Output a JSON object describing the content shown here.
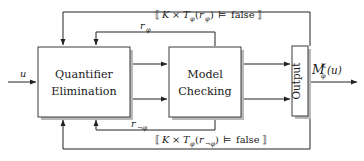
{
  "diagram": {
    "blocks": [
      {
        "id": "quantifier-elimination",
        "line1": "Quantifier",
        "line2": "Elimination"
      },
      {
        "id": "model-checking",
        "line1": "Model",
        "line2": "Checking"
      },
      {
        "id": "output",
        "label": "Output"
      }
    ],
    "input": {
      "label": "u"
    },
    "output": {
      "base": "M",
      "superscript": "K",
      "subscript": "φ",
      "argument": "(u)"
    },
    "inner_feedback": [
      {
        "id": "r-phi",
        "base": "r",
        "subscript": "φ"
      },
      {
        "id": "r-not-phi",
        "base": "r",
        "subscript": "¬φ"
      }
    ],
    "outer_feedback": [
      {
        "id": "guard-top",
        "open": "⟦",
        "k": "K",
        "times": "×",
        "t": "T",
        "t_sub": "φ",
        "arg_open": "(",
        "arg_base": "r",
        "arg_sub": "φ",
        "arg_close": ")",
        "models": "⊨",
        "value": "false",
        "close": "⟧"
      },
      {
        "id": "guard-bottom",
        "open": "⟦",
        "k": "K",
        "times": "×",
        "t": "T",
        "t_sub": "φ",
        "arg_open": "(",
        "arg_base": "r",
        "arg_sub": "¬φ",
        "arg_close": ")",
        "models": "⊨",
        "value": "false",
        "close": "⟧"
      }
    ],
    "colors": {
      "line": "#222222",
      "box_border": "#3b3b3b",
      "box_fill": "#ffffff",
      "shadow": "#b9b9b9",
      "text": "#1a1a1a",
      "background": "#ffffff"
    }
  }
}
